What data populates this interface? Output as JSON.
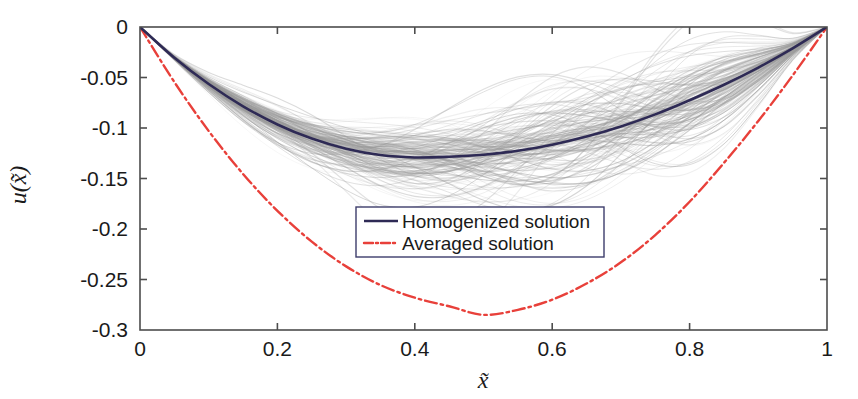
{
  "chart_data": {
    "type": "line",
    "title": "",
    "xlabel": "x̃",
    "ylabel": "u(x̃)",
    "xlabel_base": "x",
    "ylabel_base": "u",
    "xlim": [
      0,
      1
    ],
    "ylim": [
      -0.3,
      0
    ],
    "grid": false,
    "legend_position": "center",
    "xticks": [
      0,
      0.2,
      0.4,
      0.6,
      0.8,
      1
    ],
    "xtick_labels": [
      "0",
      "0.2",
      "0.4",
      "0.6",
      "0.8",
      "1"
    ],
    "yticks": [
      0,
      -0.05,
      -0.1,
      -0.15,
      -0.2,
      -0.25,
      -0.3
    ],
    "ytick_labels": [
      "0",
      "-0.05",
      "-0.1",
      "-0.15",
      "-0.2",
      "-0.25",
      "-0.3"
    ],
    "series": [
      {
        "name": "Homogenized solution",
        "style": "solid",
        "color": "#2e2a55",
        "x": [
          0,
          0.05,
          0.1,
          0.15,
          0.2,
          0.25,
          0.3,
          0.35,
          0.4,
          0.45,
          0.5,
          0.55,
          0.6,
          0.65,
          0.7,
          0.75,
          0.8,
          0.85,
          0.9,
          0.95,
          1
        ],
        "values": [
          0,
          -0.0305,
          -0.0565,
          -0.0785,
          -0.0965,
          -0.1105,
          -0.1205,
          -0.1268,
          -0.1292,
          -0.1285,
          -0.1265,
          -0.1225,
          -0.1165,
          -0.1085,
          -0.0985,
          -0.0865,
          -0.0725,
          -0.0572,
          -0.0402,
          -0.0212,
          0
        ]
      },
      {
        "name": "Averaged solution",
        "style": "dash-dot",
        "color": "#e8403a",
        "x": [
          0,
          0.05,
          0.1,
          0.15,
          0.2,
          0.25,
          0.3,
          0.35,
          0.4,
          0.45,
          0.5,
          0.55,
          0.6,
          0.65,
          0.7,
          0.75,
          0.8,
          0.85,
          0.9,
          0.95,
          1
        ],
        "values": [
          0,
          -0.0545,
          -0.103,
          -0.1455,
          -0.182,
          -0.2125,
          -0.237,
          -0.2555,
          -0.268,
          -0.2765,
          -0.285,
          -0.28,
          -0.27,
          -0.254,
          -0.233,
          -0.206,
          -0.173,
          -0.1345,
          -0.093,
          -0.048,
          0
        ]
      }
    ],
    "ensemble": {
      "name": "Realizations",
      "color": "#9a9a9a",
      "count": 160,
      "description": "Grey ensemble of individual realization solutions clustered around the homogenized solution"
    },
    "legend": [
      {
        "label": "Homogenized solution",
        "style": "solid",
        "color": "#2e2a55"
      },
      {
        "label": "Averaged solution",
        "style": "dash-dot",
        "color": "#e8403a"
      }
    ]
  }
}
